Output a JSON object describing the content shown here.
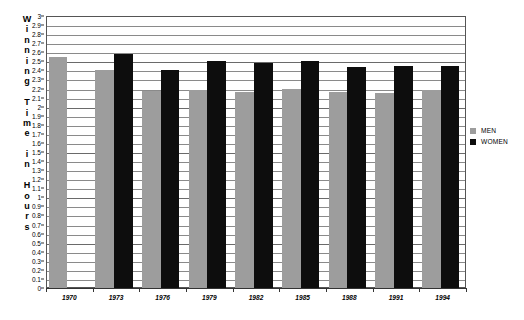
{
  "chart_data": {
    "type": "bar",
    "title": "",
    "xlabel": "",
    "ylabel": "Winning Time in Hours",
    "ylabel_chars": [
      "W",
      "i",
      "n",
      "n",
      "i",
      "n",
      "g",
      "",
      "T",
      "i",
      "m",
      "e",
      "",
      "i",
      "n",
      "",
      "H",
      "o",
      "u",
      "r",
      "s"
    ],
    "categories": [
      "1970",
      "1973",
      "1976",
      "1979",
      "1982",
      "1985",
      "1988",
      "1991",
      "1994"
    ],
    "series": [
      {
        "name": "MEN",
        "color": "#9d9d9d",
        "values": [
          2.55,
          2.4,
          2.17,
          2.18,
          2.16,
          2.2,
          2.16,
          2.15,
          2.18
        ]
      },
      {
        "name": "WOMEN",
        "color": "#0d0d0d",
        "values": [
          null,
          2.58,
          2.4,
          2.5,
          2.48,
          2.5,
          2.44,
          2.45,
          2.45
        ]
      }
    ],
    "ylim": [
      0,
      3
    ],
    "ytick_step": 0.1,
    "ytick_labels": [
      "3",
      "2.9",
      "2.8",
      "2.7",
      "2.6",
      "2.5",
      "2.4",
      "2.3",
      "2.2",
      "2.1",
      "2",
      "1.9",
      "1.8",
      "1.7",
      "1.6",
      "1.5",
      "1.4",
      "1.3",
      "1.2",
      "1.1",
      "1",
      "0.9",
      "0.8",
      "0.7",
      "0.6",
      "0.5",
      "0.4",
      "0.3",
      "0.2",
      "0.1",
      "0"
    ],
    "grid": true,
    "legend_position": "right",
    "legend": [
      {
        "label": "MEN",
        "color": "#9d9d9d"
      },
      {
        "label": "WOMEN",
        "color": "#0d0d0d"
      }
    ]
  }
}
